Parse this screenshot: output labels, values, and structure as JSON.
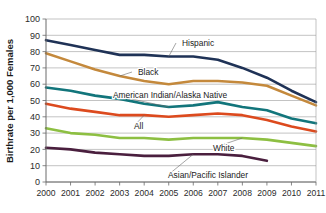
{
  "chart_data": {
    "type": "line",
    "title": "",
    "xlabel": "",
    "ylabel": "Birthrate per 1,000 Females",
    "x": [
      2000,
      2001,
      2002,
      2003,
      2004,
      2005,
      2006,
      2007,
      2008,
      2009,
      2010,
      2011
    ],
    "xtick_labels": [
      "2000",
      "2001",
      "2002",
      "2003",
      "2004",
      "2005",
      "2006",
      "2007",
      "2008",
      "2009",
      "2010",
      "2011"
    ],
    "ytick_labels": [
      "0",
      "10",
      "20",
      "30",
      "40",
      "50",
      "60",
      "70",
      "80",
      "90",
      "100"
    ],
    "yticks": [
      0,
      10,
      20,
      30,
      40,
      50,
      60,
      70,
      80,
      90,
      100
    ],
    "ylim": [
      0,
      100
    ],
    "xlim": [
      2000,
      2011
    ],
    "grid": true,
    "legend_position": "inline-annotations",
    "series": [
      {
        "name": "Hispanic",
        "color": "#1F3256",
        "values": [
          87,
          84,
          81,
          78,
          78,
          77,
          77,
          75,
          70,
          64,
          56,
          49
        ]
      },
      {
        "name": "Black",
        "color": "#C4893C",
        "values": [
          79,
          74,
          69,
          65,
          62,
          60,
          62,
          62,
          61,
          59,
          53,
          47
        ]
      },
      {
        "name": "American Indian/Alaska Native",
        "color": "#12757B",
        "values": [
          58,
          56,
          53,
          51,
          48,
          46,
          47,
          49,
          46,
          44,
          39,
          36
        ]
      },
      {
        "name": "All",
        "color": "#DC4A1E",
        "values": [
          48,
          45,
          43,
          41,
          41,
          40,
          41,
          42,
          41,
          38,
          34,
          31
        ]
      },
      {
        "name": "White",
        "color": "#8DBF42",
        "values": [
          33,
          30,
          29,
          27,
          27,
          26,
          27,
          27,
          27,
          26,
          24,
          22
        ]
      },
      {
        "name": "Asian/Pacific Islander",
        "color": "#4A1F3E",
        "values": [
          21,
          20,
          18,
          17,
          16,
          16,
          17,
          17,
          16,
          13,
          null,
          null
        ]
      }
    ],
    "annotations": [
      {
        "label": "Hispanic",
        "series": "Hispanic"
      },
      {
        "label": "Black",
        "series": "Black"
      },
      {
        "label": "American Indian/Alaska Native",
        "series": "American Indian/Alaska Native"
      },
      {
        "label": "All",
        "series": "All"
      },
      {
        "label": "White",
        "series": "White"
      },
      {
        "label": "Asian/Pacific Islander",
        "series": "Asian/Pacific Islander"
      }
    ]
  }
}
